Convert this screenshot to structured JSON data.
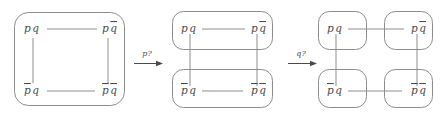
{
  "figure": {
    "node_labels": {
      "pq": {
        "first": "p",
        "first_bar": false,
        "second": "q",
        "second_bar": false
      },
      "pqb": {
        "first": "p",
        "first_bar": false,
        "second": "q",
        "second_bar": true
      },
      "pbq": {
        "first": "p",
        "first_bar": true,
        "second": "q",
        "second_bar": false
      },
      "pbqb": {
        "first": "p",
        "first_bar": true,
        "second": "q",
        "second_bar": true
      }
    },
    "arrows": [
      {
        "label": "p?"
      },
      {
        "label": "q?"
      }
    ],
    "colors": {
      "stroke": "#8d8d8d",
      "text": "#4a4a4a",
      "background": "#ffffff"
    },
    "stages": [
      {
        "name": "stage-1",
        "description": "single block containing all four valuations",
        "blocks": 1
      },
      {
        "name": "stage-2",
        "description": "two blocks split on p",
        "blocks": 2
      },
      {
        "name": "stage-3",
        "description": "four singleton blocks split on q",
        "blocks": 4
      }
    ]
  }
}
